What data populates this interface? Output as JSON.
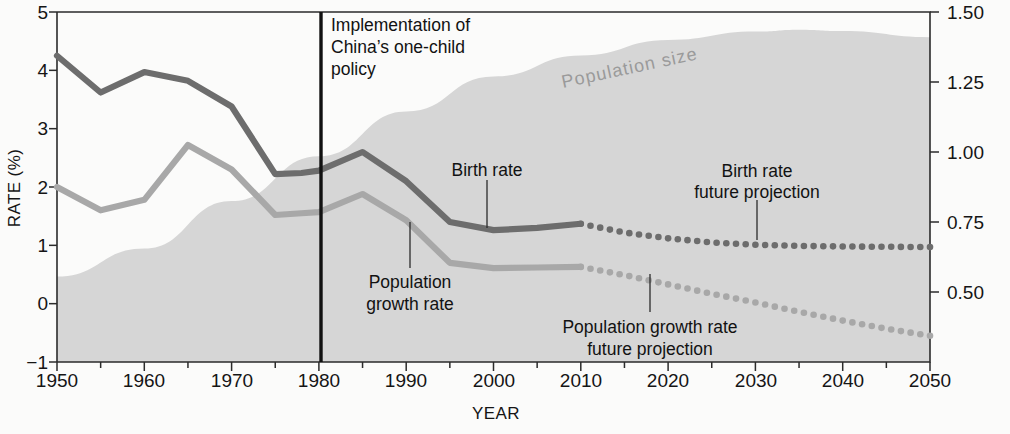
{
  "chart_data": {
    "type": "line",
    "title": "",
    "xlabel": "YEAR",
    "ylabel": "RATE (%)",
    "ylabel_right": "",
    "xlim": [
      1950,
      2050
    ],
    "ylim": [
      -1,
      5
    ],
    "ylim_right": [
      0.25,
      1.5
    ],
    "grid": false,
    "legend": "annotations on plot",
    "xticks": [
      "1950",
      "1960",
      "1970",
      "1980",
      "1990",
      "2000",
      "2010",
      "2020",
      "2030",
      "2040",
      "2050"
    ],
    "xticks_minor_step": 5,
    "yticks_left": [
      "-1",
      "0",
      "1",
      "2",
      "3",
      "4",
      "5"
    ],
    "yticks_right": [
      "0.50",
      "0.75",
      "1.00",
      "1.25",
      "1.50"
    ],
    "right_axis_units": "billions of people",
    "series": [
      {
        "name": "Birth rate",
        "style": "solid",
        "color": "#6d6d6d",
        "axis": "left",
        "x": [
          1950,
          1955,
          1960,
          1965,
          1970,
          1975,
          1978,
          1980,
          1985,
          1990,
          1995,
          2000,
          2005,
          2010
        ],
        "values": [
          4.25,
          3.62,
          3.97,
          3.82,
          3.38,
          2.22,
          2.24,
          2.28,
          2.6,
          2.1,
          1.4,
          1.26,
          1.3,
          1.37
        ]
      },
      {
        "name": "Birth rate future projection",
        "style": "dotted",
        "color": "#6d6d6d",
        "axis": "left",
        "x": [
          2010,
          2015,
          2020,
          2025,
          2030,
          2035,
          2040,
          2045,
          2050
        ],
        "values": [
          1.37,
          1.22,
          1.12,
          1.05,
          1.01,
          0.99,
          0.98,
          0.975,
          0.97
        ]
      },
      {
        "name": "Population growth rate",
        "style": "solid",
        "color": "#a8a8a8",
        "axis": "left",
        "x": [
          1950,
          1955,
          1960,
          1965,
          1970,
          1975,
          1978,
          1980,
          1985,
          1990,
          1995,
          2000,
          2005,
          2010
        ],
        "values": [
          2.0,
          1.6,
          1.78,
          2.72,
          2.3,
          1.52,
          1.55,
          1.57,
          1.88,
          1.43,
          0.7,
          0.61,
          0.62,
          0.63
        ]
      },
      {
        "name": "Population growth rate future projection",
        "style": "dotted",
        "color": "#a8a8a8",
        "axis": "left",
        "x": [
          2010,
          2015,
          2020,
          2025,
          2030,
          2035,
          2040,
          2045,
          2050
        ],
        "values": [
          0.63,
          0.49,
          0.33,
          0.17,
          0.02,
          -0.14,
          -0.29,
          -0.43,
          -0.55
        ]
      },
      {
        "name": "Population size",
        "style": "area",
        "color": "#d6d6d6",
        "axis": "right",
        "x": [
          1950,
          1960,
          1970,
          1980,
          1990,
          2000,
          2010,
          2020,
          2030,
          2035,
          2040,
          2050
        ],
        "values": [
          0.555,
          0.655,
          0.825,
          0.985,
          1.145,
          1.27,
          1.345,
          1.4,
          1.43,
          1.437,
          1.432,
          1.41
        ]
      }
    ],
    "annotations": [
      {
        "id": "policy-line",
        "text": "Implementation of\nChina’s one-child\npolicy",
        "x": 1978,
        "type": "vertical-rule"
      },
      {
        "id": "population-size",
        "text": "Population size",
        "rotation": -12
      },
      {
        "id": "birth-rate",
        "text": "Birth rate",
        "leader": true
      },
      {
        "id": "population-growth-rate",
        "text": "Population\ngrowth rate",
        "leader": true
      },
      {
        "id": "birth-rate-projection",
        "text": "Birth rate\nfuture projection",
        "leader": true
      },
      {
        "id": "population-growth-projection",
        "text": "Population growth rate\nfuture projection",
        "leader": true
      }
    ]
  },
  "labels": {
    "y_axis_title": "RATE (%)",
    "x_axis_title": "YEAR",
    "policy_line_1": "Implementation of",
    "policy_line_2": "China’s one-child",
    "policy_line_3": "policy",
    "population_size": "Population size",
    "birth_rate": "Birth rate",
    "pop_growth_line_1": "Population",
    "pop_growth_line_2": "growth rate",
    "birth_proj_line_1": "Birth rate",
    "birth_proj_line_2": "future projection",
    "pop_proj_line_1": "Population growth rate",
    "pop_proj_line_2": "future projection",
    "ytick_5": "5",
    "ytick_4": "4",
    "ytick_3": "3",
    "ytick_2": "2",
    "ytick_1": "1",
    "ytick_0": "0",
    "ytick_m1": "−1",
    "rtick_150": "1.50",
    "rtick_125": "1.25",
    "rtick_100": "1.00",
    "rtick_075": "0.75",
    "rtick_050": "0.50",
    "xtick_1950": "1950",
    "xtick_1960": "1960",
    "xtick_1970": "1970",
    "xtick_1980": "1980",
    "xtick_1990": "1990",
    "xtick_2000": "2000",
    "xtick_2010": "2010",
    "xtick_2020": "2020",
    "xtick_2030": "2030",
    "xtick_2040": "2040",
    "xtick_2050": "2050"
  },
  "colors": {
    "birth_rate": "#6d6d6d",
    "growth_rate": "#a8a8a8",
    "population_area": "#d6d6d6",
    "axis": "#2b2b2b",
    "background": "#fbfbfa"
  }
}
